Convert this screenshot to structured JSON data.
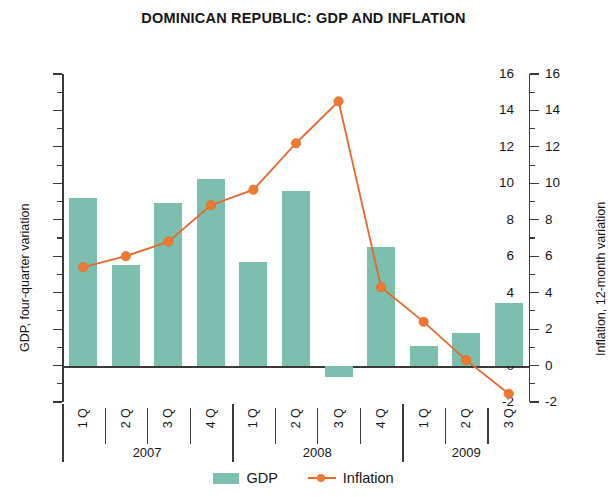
{
  "chart_data": {
    "type": "bar",
    "title": "DOMINICAN REPUBLIC: GDP AND INFLATION",
    "xlabel": "",
    "ylabel": "GDP, four-quarter variation",
    "ylabel_right": "Inflation, 12-month variation",
    "ylim": [
      -2,
      16
    ],
    "ylim_right": [
      -2,
      16
    ],
    "yticks": [
      -2,
      0,
      2,
      4,
      6,
      8,
      10,
      12,
      14,
      16
    ],
    "ytick_labels": [
      "-2",
      "0",
      "2",
      "4",
      "6",
      "8",
      "10",
      "12",
      "14",
      "16"
    ],
    "minor_ticks": true,
    "grid": false,
    "legend_position": "bottom-center",
    "categories": [
      "1 Q",
      "2 Q",
      "3 Q",
      "4 Q",
      "1 Q",
      "2 Q",
      "3 Q",
      "4 Q",
      "1 Q",
      "2 Q",
      "3 Q"
    ],
    "year_groups": [
      {
        "label": "2007",
        "quarters": [
          "1 Q",
          "2 Q",
          "3 Q",
          "4 Q"
        ]
      },
      {
        "label": "2008",
        "quarters": [
          "1 Q",
          "2 Q",
          "3 Q",
          "4 Q"
        ]
      },
      {
        "label": "2009",
        "quarters": [
          "1 Q",
          "2 Q",
          "3 Q"
        ]
      }
    ],
    "series": [
      {
        "name": "GDP",
        "kind": "bar",
        "axis": "left",
        "color": "#7cbfae",
        "values": [
          9.2,
          5.5,
          8.9,
          10.25,
          5.7,
          9.6,
          -0.65,
          6.5,
          1.05,
          1.8,
          3.45
        ]
      },
      {
        "name": "Inflation",
        "kind": "line",
        "axis": "right",
        "color": "#e8682a",
        "marker_color": "#f0792f",
        "values": [
          5.4,
          6.0,
          6.8,
          8.8,
          9.65,
          12.2,
          14.5,
          4.3,
          2.4,
          0.3,
          -1.55
        ]
      }
    ]
  },
  "legend": {
    "items": [
      {
        "label": "GDP",
        "marker": "bar-swatch"
      },
      {
        "label": "Inflation",
        "marker": "line-marker-swatch"
      }
    ]
  }
}
